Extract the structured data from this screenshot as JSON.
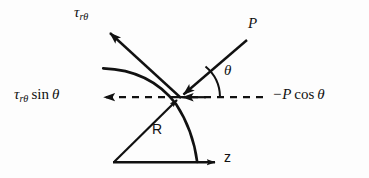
{
  "figure": {
    "type": "mechanics-force-diagram",
    "background_color": "#fdfdfd",
    "stroke_color": "#111111",
    "width": 369,
    "height": 178,
    "labels": {
      "tau_top": {
        "symbol": "τ",
        "subscript": "rθ",
        "full": "τrθ"
      },
      "tau_sin": {
        "symbol": "τ",
        "subscript": "rθ",
        "operator": "sin",
        "angle": "θ",
        "full": "τrθ sin θ"
      },
      "p": {
        "full": "P"
      },
      "p_cos": {
        "sign": "−",
        "symbol": "P",
        "operator": "cos",
        "angle": "θ",
        "full": "−P cos θ"
      },
      "theta": {
        "full": "θ"
      },
      "radius": {
        "full": "R"
      },
      "axis_z": {
        "full": "z"
      }
    },
    "geometry": {
      "origin": {
        "x": 114,
        "y": 162
      },
      "contact_point": {
        "x": 180,
        "y": 97
      },
      "radius_px": 93,
      "arc_start": {
        "x": 103,
        "y": 68
      },
      "arc_end": {
        "x": 197,
        "y": 162
      },
      "z_axis_end": {
        "x": 222,
        "y": 162
      },
      "tau_arrow_tip": {
        "x": 108,
        "y": 30
      },
      "p_line_top": {
        "x": 247,
        "y": 40
      },
      "dashed_left_tip": {
        "x": 103,
        "y": 97
      },
      "dashed_right_end": {
        "x": 268,
        "y": 97
      },
      "theta_arc_radius_px": 40
    }
  }
}
